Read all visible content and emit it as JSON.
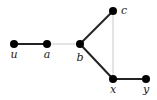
{
  "diagram": {
    "type": "graph",
    "nodes": [
      {
        "id": "u",
        "label": "u",
        "x": 14,
        "y": 44,
        "lx": 14,
        "ly": 58
      },
      {
        "id": "a",
        "label": "a",
        "x": 47,
        "y": 44,
        "lx": 47,
        "ly": 58
      },
      {
        "id": "b",
        "label": "b",
        "x": 80,
        "y": 44,
        "lx": 80,
        "ly": 61
      },
      {
        "id": "c",
        "label": "c",
        "x": 113,
        "y": 11,
        "lx": 124,
        "ly": 14
      },
      {
        "id": "x",
        "label": "x",
        "x": 113,
        "y": 79,
        "lx": 113,
        "ly": 93
      },
      {
        "id": "y",
        "label": "y",
        "x": 146,
        "y": 79,
        "lx": 146,
        "ly": 93
      }
    ],
    "edges": [
      {
        "from": "u",
        "to": "a",
        "style": "thick"
      },
      {
        "from": "a",
        "to": "b",
        "style": "thin"
      },
      {
        "from": "b",
        "to": "c",
        "style": "thick"
      },
      {
        "from": "b",
        "to": "x",
        "style": "thick"
      },
      {
        "from": "c",
        "to": "x",
        "style": "thin"
      },
      {
        "from": "x",
        "to": "y",
        "style": "thick"
      }
    ],
    "colors": {
      "node": "#000000",
      "thick_edge": "#222222",
      "thin_edge": "#bbbbbb",
      "label": "#222222"
    }
  }
}
